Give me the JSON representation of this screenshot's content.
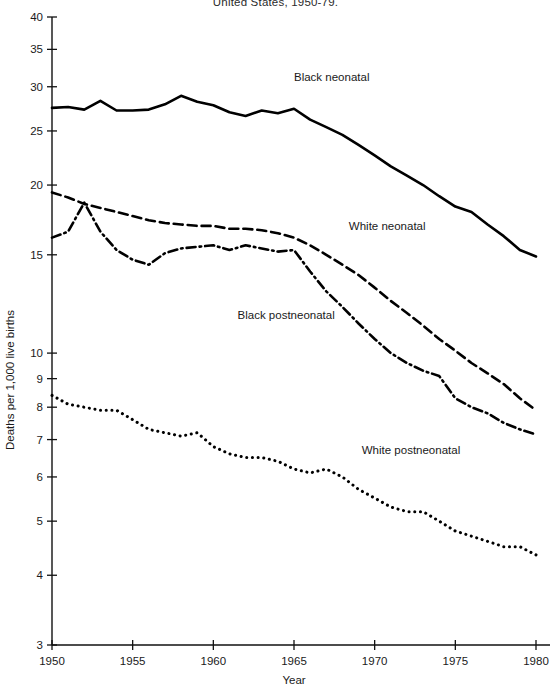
{
  "chart_data": {
    "type": "line",
    "title": "United States, 1950-79.",
    "xlabel": "Year",
    "ylabel": "Deaths per 1,000 live births",
    "yscale": "log",
    "ylim": [
      3,
      40
    ],
    "xlim": [
      1950,
      1980
    ],
    "grid": false,
    "legend_position": "inline-annotations",
    "ytick_labels": [
      "40",
      "35",
      "30",
      "25",
      "20",
      "15",
      "10",
      "9",
      "8",
      "7",
      "6",
      "5",
      "4",
      "3"
    ],
    "ytick_values": [
      40,
      35,
      30,
      25,
      20,
      15,
      10,
      9,
      8,
      7,
      6,
      5,
      4,
      3
    ],
    "xtick_labels": [
      "1950",
      "1955",
      "1960",
      "1965",
      "1970",
      "1975",
      "1980"
    ],
    "xtick_values": [
      1950,
      1955,
      1960,
      1965,
      1970,
      1975,
      1980
    ],
    "x": [
      1950,
      1951,
      1952,
      1953,
      1954,
      1955,
      1956,
      1957,
      1958,
      1959,
      1960,
      1961,
      1962,
      1963,
      1964,
      1965,
      1966,
      1967,
      1968,
      1969,
      1970,
      1971,
      1972,
      1973,
      1974,
      1975,
      1976,
      1977,
      1978,
      1979,
      1980
    ],
    "series": [
      {
        "name": "Black neonatal",
        "style": "solid",
        "label_x": 1965.0,
        "label_y": 30.7,
        "values": [
          27.5,
          27.6,
          27.3,
          28.3,
          27.2,
          27.2,
          27.3,
          27.9,
          28.9,
          28.2,
          27.8,
          27.0,
          26.6,
          27.2,
          26.9,
          27.4,
          26.2,
          25.4,
          24.6,
          23.6,
          22.6,
          21.6,
          20.8,
          20.0,
          19.1,
          18.3,
          17.9,
          17.0,
          16.2,
          15.3,
          14.9
        ],
        "label": "Black neonatal"
      },
      {
        "name": "White neonatal",
        "style": "dashed",
        "label_x": 1968.4,
        "label_y": 16.6,
        "values": [
          19.4,
          19.0,
          18.5,
          18.2,
          17.9,
          17.6,
          17.3,
          17.1,
          17.0,
          16.9,
          16.9,
          16.7,
          16.7,
          16.6,
          16.4,
          16.1,
          15.6,
          15.0,
          14.4,
          13.8,
          13.1,
          12.4,
          11.8,
          11.2,
          10.6,
          10.1,
          9.6,
          9.2,
          8.8,
          8.3,
          7.9
        ],
        "label": "White neonatal"
      },
      {
        "name": "Black postneonatal",
        "style": "dashdot",
        "label_x": 1961.5,
        "label_y": 11.5,
        "values": [
          16.1,
          16.5,
          18.6,
          16.5,
          15.3,
          14.7,
          14.4,
          15.1,
          15.4,
          15.5,
          15.6,
          15.3,
          15.6,
          15.4,
          15.2,
          15.3,
          14.0,
          12.9,
          12.1,
          11.3,
          10.6,
          10.0,
          9.6,
          9.3,
          9.1,
          8.3,
          8.0,
          7.8,
          7.5,
          7.3,
          7.15
        ],
        "label": "Black postneonatal"
      },
      {
        "name": "White postneonatal",
        "style": "dotted",
        "label_x": 1969.2,
        "label_y": 6.6,
        "values": [
          8.4,
          8.1,
          8.0,
          7.9,
          7.9,
          7.6,
          7.3,
          7.2,
          7.1,
          7.2,
          6.8,
          6.6,
          6.5,
          6.5,
          6.4,
          6.2,
          6.1,
          6.2,
          6.0,
          5.7,
          5.5,
          5.3,
          5.2,
          5.2,
          5.0,
          4.8,
          4.7,
          4.6,
          4.5,
          4.5,
          4.35
        ],
        "label": "White postneonatal"
      }
    ]
  }
}
